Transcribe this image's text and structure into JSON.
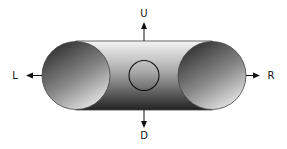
{
  "diagram": {
    "labels": {
      "up": "U",
      "down": "D",
      "left": "L",
      "right": "R"
    },
    "colors": {
      "outline": "#333333",
      "arrow": "#111111",
      "body_light": "#f2f2f2",
      "body_dark": "#2a2a2a",
      "end_dark": "#3a3a3a",
      "end_light": "#e6e6e6"
    }
  }
}
